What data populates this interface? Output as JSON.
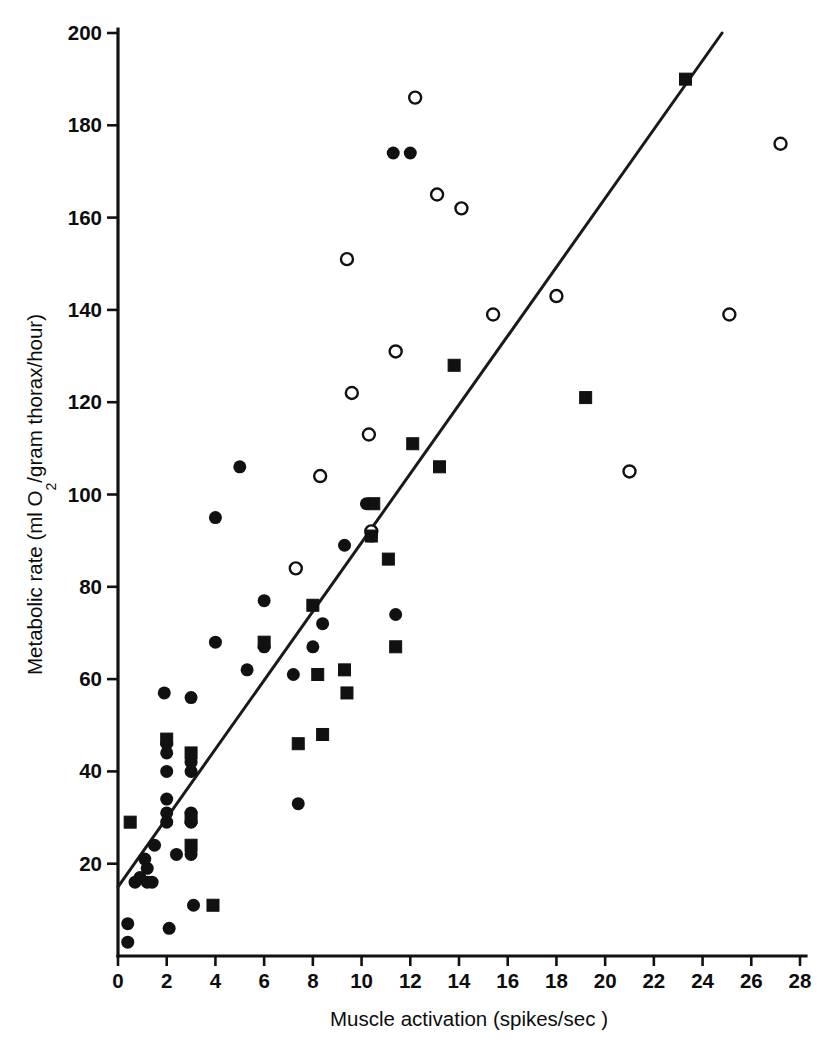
{
  "figure": {
    "background_color": "#ffffff",
    "ink_color": "#111111"
  },
  "chart_data": {
    "type": "scatter",
    "title": "",
    "subtitle": "",
    "xlabel": "Muscle activation (spikes/sec )",
    "ylabel": "Metabolic rate (ml O2/gram thorax/hour)",
    "ylabel_parts": {
      "lead": "Metabolic rate (ml O",
      "subscript": "2",
      "tail": "/gram thorax/hour)"
    },
    "xlim": [
      0,
      28
    ],
    "ylim": [
      0,
      200
    ],
    "xticks": [
      0,
      2,
      4,
      6,
      8,
      10,
      12,
      14,
      16,
      18,
      20,
      22,
      24,
      26,
      28
    ],
    "yticks": [
      0,
      20,
      40,
      60,
      80,
      100,
      120,
      140,
      160,
      180,
      200
    ],
    "xtick_labels": [
      "0",
      "2",
      "4",
      "6",
      "8",
      "10",
      "12",
      "14",
      "16",
      "18",
      "20",
      "22",
      "24",
      "26",
      "28"
    ],
    "ytick_labels": [
      "",
      "20",
      "40",
      "60",
      "80",
      "100",
      "120",
      "140",
      "160",
      "180",
      "200"
    ],
    "grid": false,
    "legend": null,
    "legend_position": "none",
    "annotations": [],
    "trend_line": {
      "name": "regression-line",
      "x_start": 0.0,
      "y_start": 15.0,
      "x_end": 24.8,
      "y_end": 200.0,
      "color": "#1a1a1a",
      "width": 3
    },
    "series": [
      {
        "name": "filled-circle",
        "marker": "filled-circle",
        "color": "#111111",
        "size": 13,
        "points": [
          [
            0.4,
            7
          ],
          [
            0.4,
            3
          ],
          [
            0.7,
            16
          ],
          [
            0.9,
            17
          ],
          [
            1.1,
            21
          ],
          [
            1.2,
            19
          ],
          [
            1.2,
            16
          ],
          [
            1.4,
            16
          ],
          [
            1.5,
            24
          ],
          [
            1.9,
            57
          ],
          [
            2.0,
            46
          ],
          [
            2.0,
            44
          ],
          [
            2.0,
            40
          ],
          [
            2.0,
            34
          ],
          [
            2.0,
            31
          ],
          [
            2.0,
            29
          ],
          [
            2.1,
            6
          ],
          [
            2.4,
            22
          ],
          [
            3.0,
            56
          ],
          [
            3.0,
            42
          ],
          [
            3.0,
            40
          ],
          [
            3.0,
            31
          ],
          [
            3.0,
            29
          ],
          [
            3.0,
            22
          ],
          [
            3.1,
            11
          ],
          [
            4.0,
            95
          ],
          [
            4.0,
            68
          ],
          [
            5.0,
            106
          ],
          [
            5.3,
            62
          ],
          [
            6.0,
            77
          ],
          [
            6.0,
            67
          ],
          [
            7.2,
            61
          ],
          [
            7.4,
            33
          ],
          [
            8.0,
            67
          ],
          [
            8.4,
            72
          ],
          [
            9.3,
            89
          ],
          [
            10.2,
            98
          ],
          [
            10.4,
            91
          ],
          [
            11.3,
            174
          ],
          [
            11.4,
            74
          ],
          [
            12.0,
            174
          ]
        ]
      },
      {
        "name": "open-circle",
        "marker": "open-circle",
        "color": "#111111",
        "size": 12,
        "points": [
          [
            7.3,
            84
          ],
          [
            8.3,
            104
          ],
          [
            9.4,
            151
          ],
          [
            9.6,
            122
          ],
          [
            10.3,
            113
          ],
          [
            10.4,
            92
          ],
          [
            11.4,
            131
          ],
          [
            12.2,
            186
          ],
          [
            13.1,
            165
          ],
          [
            14.1,
            162
          ],
          [
            15.4,
            139
          ],
          [
            18.0,
            143
          ],
          [
            21.0,
            105
          ],
          [
            25.1,
            139
          ],
          [
            27.2,
            176
          ]
        ]
      },
      {
        "name": "filled-square",
        "marker": "filled-square",
        "color": "#111111",
        "size": 12,
        "points": [
          [
            0.5,
            29
          ],
          [
            2.0,
            47
          ],
          [
            3.0,
            44
          ],
          [
            3.0,
            30
          ],
          [
            3.0,
            24
          ],
          [
            3.9,
            11
          ],
          [
            6.0,
            68
          ],
          [
            7.4,
            46
          ],
          [
            8.0,
            76
          ],
          [
            8.2,
            61
          ],
          [
            8.4,
            48
          ],
          [
            9.3,
            62
          ],
          [
            9.4,
            57
          ],
          [
            10.4,
            91
          ],
          [
            10.5,
            98
          ],
          [
            11.1,
            86
          ],
          [
            11.4,
            67
          ],
          [
            12.1,
            111
          ],
          [
            13.2,
            106
          ],
          [
            13.8,
            128
          ],
          [
            19.2,
            121
          ],
          [
            23.3,
            190
          ]
        ]
      }
    ]
  }
}
